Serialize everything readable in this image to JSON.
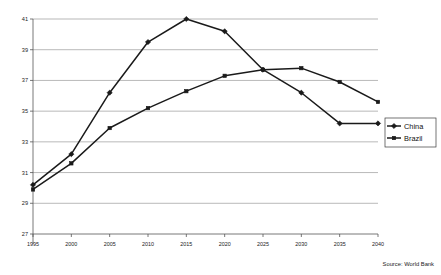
{
  "chart_data": {
    "type": "line",
    "title": "",
    "subtitle": "",
    "xlabel": "",
    "ylabel": "",
    "categories": [
      "1995",
      "2000",
      "2005",
      "2010",
      "2015",
      "2020",
      "2025",
      "2030",
      "2035",
      "2040"
    ],
    "x": [
      1995,
      2000,
      2005,
      2010,
      2015,
      2020,
      2025,
      2030,
      2035,
      2040
    ],
    "series": [
      {
        "name": "China",
        "marker": "diamond",
        "color": "#1a1a1a",
        "values": [
          30.2,
          32.2,
          36.2,
          39.5,
          41.0,
          40.2,
          37.7,
          36.2,
          34.2,
          34.2
        ]
      },
      {
        "name": "Brazil",
        "marker": "square",
        "color": "#1a1a1a",
        "values": [
          29.9,
          31.6,
          33.9,
          35.2,
          36.3,
          37.3,
          37.7,
          37.8,
          36.9,
          35.6
        ]
      }
    ],
    "ylim": [
      27,
      41
    ],
    "yticks": [
      27,
      29,
      31,
      33,
      35,
      37,
      39,
      41
    ],
    "ytick_labels": [
      "27",
      "29",
      "31",
      "33",
      "35",
      "37",
      "39",
      "41"
    ],
    "xlim": [
      1995,
      2040
    ],
    "grid": "horizontal",
    "legend_position": "right",
    "annotations": [
      "Source: World Bank"
    ]
  },
  "legend": {
    "items": [
      {
        "label": "China"
      },
      {
        "label": "Brazil"
      }
    ]
  },
  "footer": {
    "source": "Source: World Bank"
  }
}
